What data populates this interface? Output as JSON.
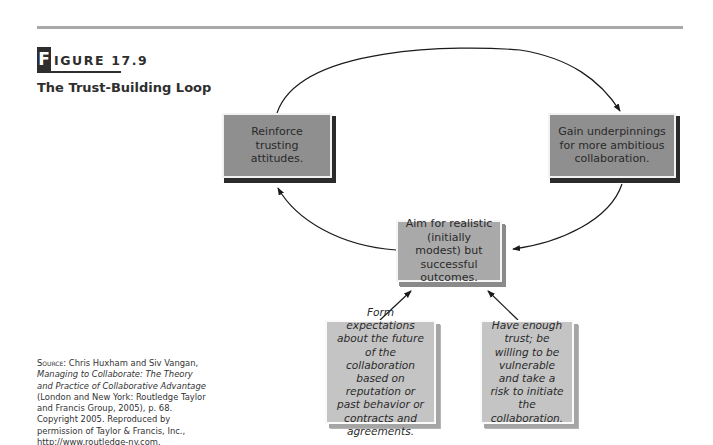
{
  "figure": {
    "letter": "F",
    "label_rest": "IGURE 17.9",
    "title": "The Trust-Building Loop"
  },
  "source": {
    "prefix": "Source:",
    "authors": "Chris Huxham and Siv Vangan,",
    "book_title": "Managing to Collaborate: The Theory and Practice of Collaborative Advantage",
    "rest": "(London and New York: Routledge Taylor and Francis Group, 2005), p. 68. Copyright 2005. Reproduced by permission of Taylor & Francis, Inc., http://www.routledge-ny.com."
  },
  "nodes": {
    "reinforce": "Reinforce trusting attitudes.",
    "gain": "Gain underpinnings for more ambitious collaboration.",
    "aim": "Aim for realistic (initially modest) but successful outcomes.",
    "form": "Form expectations about the future of the collaboration based on reputation or past behavior or contracts and agreements.",
    "have": "Have enough trust; be willing to be vulnerable and take a risk to initiate the collaboration."
  },
  "edges": [
    {
      "from": "reinforce",
      "to": "gain"
    },
    {
      "from": "gain",
      "to": "aim"
    },
    {
      "from": "aim",
      "to": "reinforce"
    },
    {
      "from": "form",
      "to": "aim"
    },
    {
      "from": "have",
      "to": "aim"
    }
  ],
  "colors": {
    "rule": "#a9a9a9",
    "dark_box": "#8f8f8f",
    "mid_box": "#a9a9a9",
    "light_box": "#c4c4c4",
    "shadow": "#2b2b2b"
  }
}
